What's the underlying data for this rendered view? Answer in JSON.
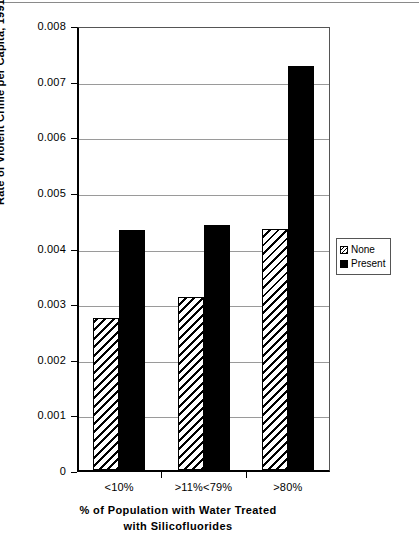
{
  "chart_data": {
    "type": "bar",
    "title": "",
    "categories": [
      "<10%",
      ">11%<79%",
      ">80%"
    ],
    "series": [
      {
        "name": "None",
        "values": [
          0.00273,
          0.00311,
          0.00433
        ]
      },
      {
        "name": "Present",
        "values": [
          0.00431,
          0.00441,
          0.00727
        ]
      }
    ],
    "xlabel_line1": "% of Population with Water Treated",
    "xlabel_line2": "with  Silicofluorides",
    "ylabel": "Rate of Violent Crime per Capita, 1991",
    "ylim": [
      0,
      0.008
    ],
    "ytick_labels": [
      "0.008",
      "0.007",
      "0.006",
      "0.005",
      "0.004",
      "0.003",
      "0.002",
      "0.001",
      "0"
    ],
    "ytick_values": [
      0.008,
      0.007,
      0.006,
      0.005,
      0.004,
      0.003,
      0.002,
      0.001,
      0
    ],
    "grid": true,
    "legend_position": "right",
    "legend_entries": [
      "None",
      "Present"
    ],
    "colors": {
      "none": "#000000",
      "present": "#000000",
      "grid": "#9a9a9a",
      "background": "#ffffff"
    }
  }
}
